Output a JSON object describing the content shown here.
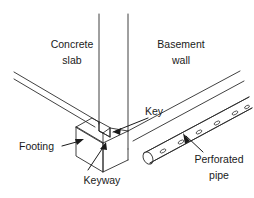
{
  "figure": {
    "kind": "isometric-construction-detail",
    "title_visible": false,
    "background_color": "#ffffff",
    "line_color": "#2b2b2b",
    "text_color": "#1a1a1a",
    "width": 254,
    "height": 198
  },
  "labels": {
    "concrete_slab_line1": "Concrete",
    "concrete_slab_line2": "slab",
    "basement_wall_line1": "Basement",
    "basement_wall_line2": "wall",
    "key": "Key",
    "footing": "Footing",
    "keyway": "Keyway",
    "perforated_pipe_line1": "Perforated",
    "perforated_pipe_line2": "pipe"
  },
  "parts": [
    {
      "id": "concrete-slab",
      "label": "Concrete slab",
      "has_leader": false
    },
    {
      "id": "basement-wall",
      "label": "Basement wall",
      "has_leader": false
    },
    {
      "id": "key",
      "label": "Key",
      "has_leader": true
    },
    {
      "id": "footing",
      "label": "Footing",
      "has_leader": true
    },
    {
      "id": "keyway",
      "label": "Keyway",
      "has_leader": true
    },
    {
      "id": "perforated-pipe",
      "label": "Perforated pipe",
      "has_leader": true
    }
  ],
  "perforations": {
    "count": 6,
    "shape": "ellipse"
  }
}
